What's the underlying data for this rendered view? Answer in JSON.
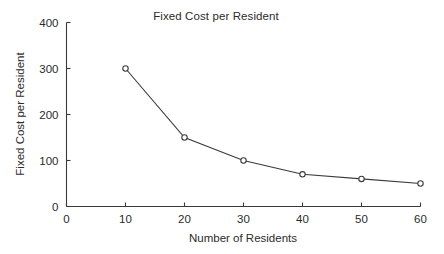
{
  "chart_data": {
    "type": "line",
    "title": "Fixed Cost per Resident",
    "xlabel": "Number of Residents",
    "ylabel": "Fixed Cost per Resident",
    "x": [
      10,
      20,
      30,
      40,
      50,
      60
    ],
    "values": [
      300,
      150,
      100,
      70,
      60,
      50
    ],
    "series": [
      {
        "name": "Fixed Cost per Resident",
        "x": [
          10,
          20,
          30,
          40,
          50,
          60
        ],
        "values": [
          300,
          150,
          100,
          70,
          60,
          50
        ]
      }
    ],
    "xlim": [
      0,
      60
    ],
    "ylim": [
      0,
      400
    ],
    "xticks": [
      0,
      10,
      20,
      30,
      40,
      50,
      60
    ],
    "yticks": [
      0,
      100,
      200,
      300,
      400
    ],
    "xtick_labels": [
      "0",
      "10",
      "20",
      "30",
      "40",
      "50",
      "60"
    ],
    "ytick_labels": [
      "0",
      "100",
      "200",
      "300",
      "400"
    ],
    "grid": false,
    "legend": false,
    "legend_position": "none",
    "marker": "open-circle",
    "line_color": "#3a3a3a",
    "marker_color": "#3a3a3a",
    "axis_color": "#3a3a3a",
    "background_color": "#ffffff",
    "tick_direction": "in",
    "frame": [
      "left",
      "bottom"
    ],
    "annotations": []
  }
}
